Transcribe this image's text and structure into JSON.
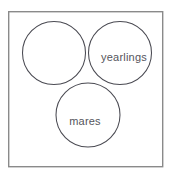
{
  "figure": {
    "type": "venn-diagram",
    "set_count": 3,
    "background_color": "#ffffff",
    "frame": {
      "border_color": "#8a8a8a",
      "fill_color": "#ffffff",
      "x": 8,
      "y": 11,
      "width": 155,
      "height": 156
    },
    "circle_stroke_color": "#4a4a52",
    "shade_color": "#e6e6e3",
    "label_color": "#55555c",
    "circles": [
      {
        "id": "left-circle",
        "label": "",
        "cx": 54,
        "cy": 53,
        "r": 31.5
      },
      {
        "id": "right-circle",
        "label": "yearlings",
        "cx": 120,
        "cy": 53,
        "r": 31.5
      },
      {
        "id": "bottom-circle",
        "label": "mares",
        "cx": 88,
        "cy": 115,
        "r": 32
      }
    ],
    "labels": [
      {
        "id": "yearlings-label",
        "text": "yearlings",
        "x": 124,
        "y": 61
      },
      {
        "id": "mares-label",
        "text": "mares",
        "x": 85,
        "y": 125
      }
    ],
    "shaded_region": {
      "description": "intersection of yearlings and mares excluding the unlabeled left set",
      "fill": "#e6e6e3"
    }
  }
}
